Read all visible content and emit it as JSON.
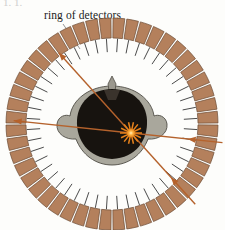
{
  "figure": {
    "title_label": "ring of detectors",
    "caption_fragment": "1.  1.",
    "background_color": "#fdfdfb"
  },
  "detector_ring": {
    "name": "ring of detectors",
    "segment_count": 48,
    "fill_color": "#b4805c",
    "edge_color": "#6b4a33",
    "outer_radius": 106,
    "inner_radius": 86,
    "center_x": 112,
    "center_y": 124,
    "tick_count": 48,
    "tick_color": "#4a4a4a",
    "tick_length": 14
  },
  "leader_line": {
    "name": "label-leader-line",
    "color": "#8a8a8a",
    "from_x": 63,
    "from_y": 24,
    "to_x": 80,
    "to_y": 48
  },
  "patient": {
    "name": "head-cross-section",
    "hair_color": "#17130f",
    "tissue_color": "#a9a79c",
    "outline_color": "#54524a",
    "nose_color": "#9a978d",
    "center_x": 112,
    "center_y": 124
  },
  "annihilation_event": {
    "name": "annihilation-point",
    "color": "#e8821b",
    "core_color": "#ffd27a",
    "x": 131,
    "y": 133,
    "burst_rays": 14,
    "burst_radius": 11
  },
  "gamma_rays": {
    "color": "#b5622c",
    "paths": [
      {
        "name": "gamma-ray-west",
        "angle_deg": 186,
        "direction": "outward",
        "length": 118
      },
      {
        "name": "gamma-ray-east",
        "angle_deg": 6,
        "direction": "inward",
        "length": 92
      },
      {
        "name": "gamma-ray-southwest",
        "angle_deg": 228,
        "direction": "outward",
        "length": 108
      },
      {
        "name": "gamma-ray-northeast",
        "angle_deg": 48,
        "direction": "inward",
        "length": 96
      }
    ]
  }
}
